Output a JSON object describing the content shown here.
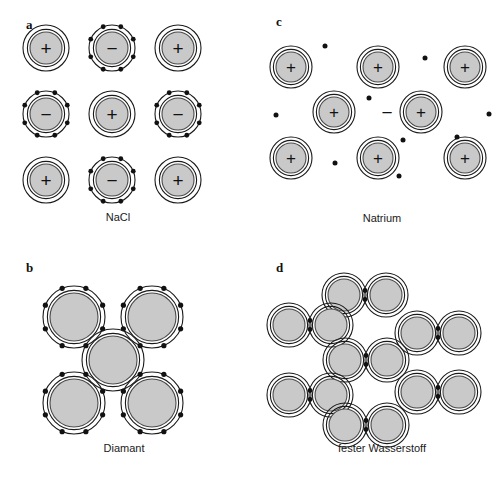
{
  "figure": {
    "width": 504,
    "height": 490,
    "background_color": "#ffffff",
    "ink_color": "#111111",
    "core_fill_color": "#c9c9c9",
    "core_stroke_color": "#4a4a4a"
  },
  "panels": [
    {
      "id": "panel-a",
      "letter": "a",
      "letter_pos": {
        "x": 26,
        "y": 29
      },
      "caption": "NaCl",
      "caption_pos": {
        "x": 118,
        "y": 221
      },
      "bond_type": "ionic",
      "atom_outer_radius": 23,
      "atom_core_radius": 16,
      "electron_dot_radius": 2.4,
      "atoms": [
        {
          "name": "cation-1",
          "cx": 46,
          "cy": 48,
          "charge": "+",
          "electrons": 0
        },
        {
          "name": "anion-1",
          "cx": 112,
          "cy": 48,
          "charge": "−",
          "electrons": 8
        },
        {
          "name": "cation-2",
          "cx": 178,
          "cy": 48,
          "charge": "+",
          "electrons": 0
        },
        {
          "name": "anion-2",
          "cx": 46,
          "cy": 114,
          "charge": "−",
          "electrons": 8
        },
        {
          "name": "cation-3",
          "cx": 112,
          "cy": 114,
          "charge": "+",
          "electrons": 0
        },
        {
          "name": "anion-3",
          "cx": 178,
          "cy": 114,
          "charge": "−",
          "electrons": 8
        },
        {
          "name": "cation-4",
          "cx": 46,
          "cy": 180,
          "charge": "+",
          "electrons": 0
        },
        {
          "name": "anion-4",
          "cx": 112,
          "cy": 180,
          "charge": "−",
          "electrons": 8
        },
        {
          "name": "cation-5",
          "cx": 178,
          "cy": 180,
          "charge": "+",
          "electrons": 0
        }
      ],
      "free_electrons": [],
      "free_charges": []
    },
    {
      "id": "panel-b",
      "letter": "b",
      "letter_pos": {
        "x": 26,
        "y": 272
      },
      "caption": "Diamant",
      "caption_pos": {
        "x": 124,
        "y": 452
      },
      "bond_type": "covalent",
      "atom_outer_radius": 31,
      "atom_core_radius": 24,
      "electron_dot_radius": 2.6,
      "atoms": [
        {
          "name": "carbon-top-left",
          "cx": 74,
          "cy": 317,
          "charge": "",
          "electrons": 8
        },
        {
          "name": "carbon-top-right",
          "cx": 152,
          "cy": 317,
          "charge": "",
          "electrons": 8
        },
        {
          "name": "carbon-center",
          "cx": 113,
          "cy": 360,
          "charge": "",
          "electrons": 0
        },
        {
          "name": "carbon-bottom-left",
          "cx": 74,
          "cy": 403,
          "charge": "",
          "electrons": 8
        },
        {
          "name": "carbon-bottom-right",
          "cx": 152,
          "cy": 403,
          "charge": "",
          "electrons": 8
        }
      ],
      "free_electrons": [],
      "free_charges": []
    },
    {
      "id": "panel-c",
      "letter": "c",
      "letter_pos": {
        "x": 276,
        "y": 26
      },
      "caption": "Natrium",
      "caption_pos": {
        "x": 382,
        "y": 222
      },
      "bond_type": "metallic",
      "atom_outer_radius": 21,
      "atom_core_radius": 15,
      "electron_dot_radius": 2.5,
      "atoms": [
        {
          "name": "sodium-ion-1",
          "cx": 291,
          "cy": 67,
          "charge": "+",
          "electrons": 0
        },
        {
          "name": "sodium-ion-2",
          "cx": 378,
          "cy": 67,
          "charge": "+",
          "electrons": 0
        },
        {
          "name": "sodium-ion-3",
          "cx": 465,
          "cy": 67,
          "charge": "+",
          "electrons": 0
        },
        {
          "name": "sodium-ion-4",
          "cx": 334,
          "cy": 112,
          "charge": "+",
          "electrons": 0
        },
        {
          "name": "sodium-ion-5",
          "cx": 421,
          "cy": 112,
          "charge": "+",
          "electrons": 0
        },
        {
          "name": "sodium-ion-6",
          "cx": 291,
          "cy": 158,
          "charge": "+",
          "electrons": 0
        },
        {
          "name": "sodium-ion-7",
          "cx": 378,
          "cy": 158,
          "charge": "+",
          "electrons": 0
        },
        {
          "name": "sodium-ion-8",
          "cx": 465,
          "cy": 158,
          "charge": "+",
          "electrons": 0
        }
      ],
      "free_electrons": [
        {
          "cx": 325,
          "cy": 46
        },
        {
          "cx": 425,
          "cy": 58
        },
        {
          "cx": 276,
          "cy": 115
        },
        {
          "cx": 369,
          "cy": 98
        },
        {
          "cx": 457,
          "cy": 137
        },
        {
          "cx": 335,
          "cy": 163
        },
        {
          "cx": 403,
          "cy": 140
        },
        {
          "cx": 399,
          "cy": 176
        },
        {
          "cx": 489,
          "cy": 114
        }
      ],
      "free_charges": [
        {
          "name": "free-negative-charge",
          "cx": 387,
          "cy": 112,
          "symbol": "−"
        }
      ]
    },
    {
      "id": "panel-d",
      "letter": "d",
      "letter_pos": {
        "x": 276,
        "y": 272
      },
      "caption": "fester Wasserstoff",
      "caption_pos": {
        "x": 382,
        "y": 452
      },
      "bond_type": "molecular",
      "atom_outer_radius": 22,
      "atom_core_radius": 16,
      "electron_dot_radius": 2.4,
      "molecule_half_gap": 21,
      "molecules": [
        {
          "name": "h2-molecule-top-center",
          "cx": 365,
          "cy": 295
        },
        {
          "name": "h2-molecule-left-upper",
          "cx": 310,
          "cy": 325
        },
        {
          "name": "h2-molecule-right-upper",
          "cx": 438,
          "cy": 333
        },
        {
          "name": "h2-molecule-center",
          "cx": 366,
          "cy": 360
        },
        {
          "name": "h2-molecule-left-lower",
          "cx": 310,
          "cy": 395
        },
        {
          "name": "h2-molecule-right-lower",
          "cx": 438,
          "cy": 392
        },
        {
          "name": "h2-molecule-bottom-center",
          "cx": 366,
          "cy": 425
        }
      ],
      "atoms": [],
      "free_electrons": [],
      "free_charges": []
    }
  ]
}
